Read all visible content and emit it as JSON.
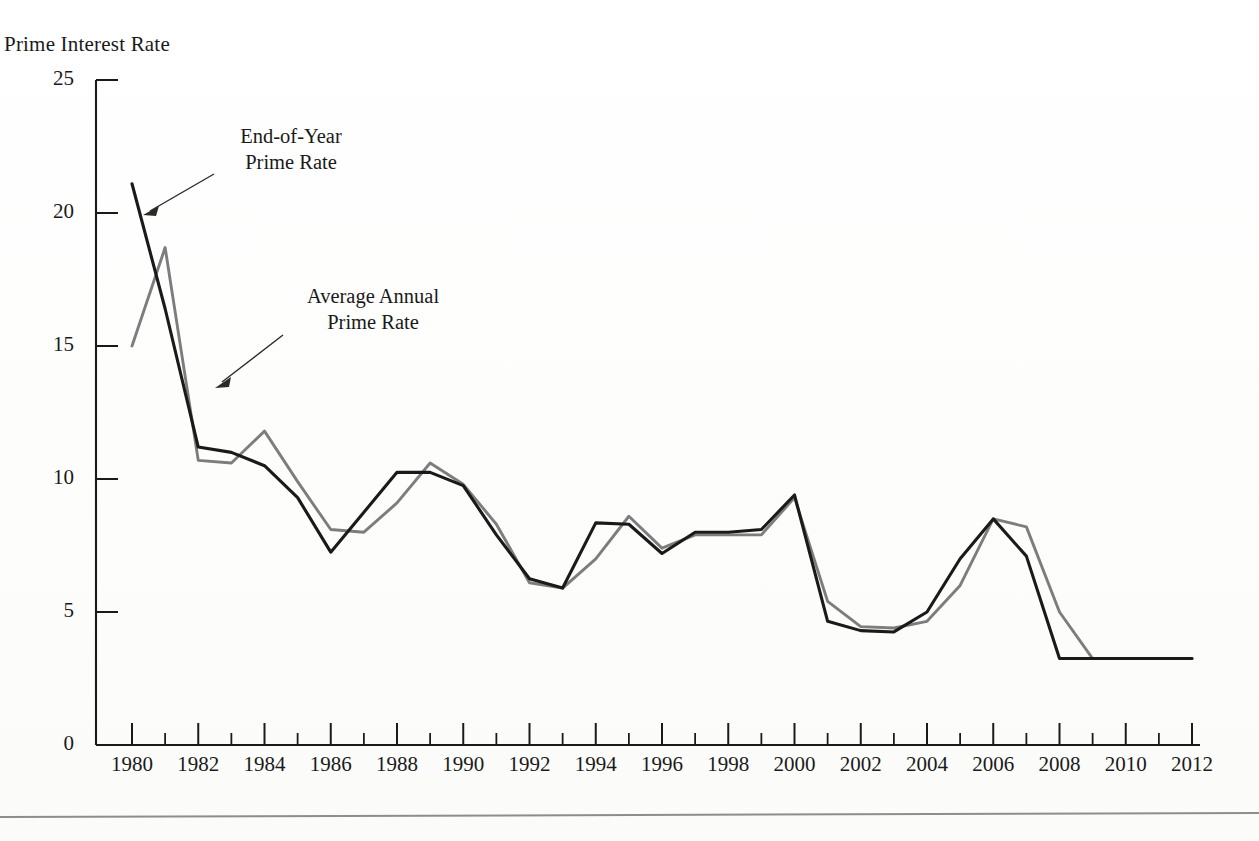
{
  "figure": {
    "y_axis_title": "Prime Interest Rate"
  },
  "annotations": [
    {
      "id": "end-of-year",
      "line1": "End-of-Year",
      "line2": "Prime Rate"
    },
    {
      "id": "average-annual",
      "line1": "Average Annual",
      "line2": "Prime Rate"
    }
  ],
  "chart_data": {
    "type": "line",
    "title": "",
    "xlabel": "",
    "ylabel": "Prime Interest Rate",
    "xlim": [
      1980,
      2012
    ],
    "ylim": [
      0,
      25
    ],
    "grid": false,
    "legend": "annotations-with-arrows",
    "y_ticks": [
      0,
      5,
      10,
      15,
      20,
      25
    ],
    "y_tick_labels": [
      "0",
      "5",
      "10",
      "15",
      "20",
      "25"
    ],
    "x_ticks": [
      1980,
      1982,
      1984,
      1986,
      1988,
      1990,
      1992,
      1994,
      1996,
      1998,
      2000,
      2002,
      2004,
      2006,
      2008,
      2010,
      2012
    ],
    "x_tick_labels": [
      "1980",
      "1982",
      "1984",
      "1986",
      "1988",
      "1990",
      "1992",
      "1994",
      "1996",
      "1998",
      "2000",
      "2002",
      "2004",
      "2006",
      "2008",
      "2010",
      "2012"
    ],
    "x_minor_ticks": [
      1981,
      1983,
      1985,
      1987,
      1989,
      1991,
      1993,
      1995,
      1997,
      1999,
      2001,
      2003,
      2005,
      2007,
      2009,
      2011
    ],
    "x": [
      1980,
      1981,
      1982,
      1983,
      1984,
      1985,
      1986,
      1987,
      1988,
      1989,
      1990,
      1991,
      1992,
      1993,
      1994,
      1995,
      1996,
      1997,
      1998,
      1999,
      2000,
      2001,
      2002,
      2003,
      2004,
      2005,
      2006,
      2007,
      2008,
      2009,
      2010,
      2011,
      2012
    ],
    "series": [
      {
        "name": "End-of-Year Prime Rate",
        "color": "#1a1a1a",
        "values": [
          21.1,
          16.4,
          11.2,
          11.0,
          10.5,
          9.3,
          7.25,
          8.75,
          10.25,
          10.25,
          9.75,
          7.9,
          6.25,
          5.9,
          8.35,
          8.3,
          7.2,
          8.0,
          8.0,
          8.1,
          9.4,
          4.65,
          4.3,
          4.25,
          5.0,
          7.0,
          8.5,
          7.1,
          3.25,
          3.25,
          3.25,
          3.25,
          3.25
        ]
      },
      {
        "name": "Average Annual Prime Rate",
        "color": "#7d7d7d",
        "values": [
          15.0,
          18.7,
          10.7,
          10.6,
          11.8,
          9.9,
          8.1,
          8.0,
          9.1,
          10.6,
          9.8,
          8.3,
          6.1,
          5.9,
          7.0,
          8.6,
          7.4,
          7.9,
          7.9,
          7.9,
          9.3,
          5.4,
          4.45,
          4.4,
          4.65,
          6.0,
          8.5,
          8.2,
          5.0,
          3.25,
          3.25,
          3.25,
          3.25
        ]
      }
    ]
  }
}
